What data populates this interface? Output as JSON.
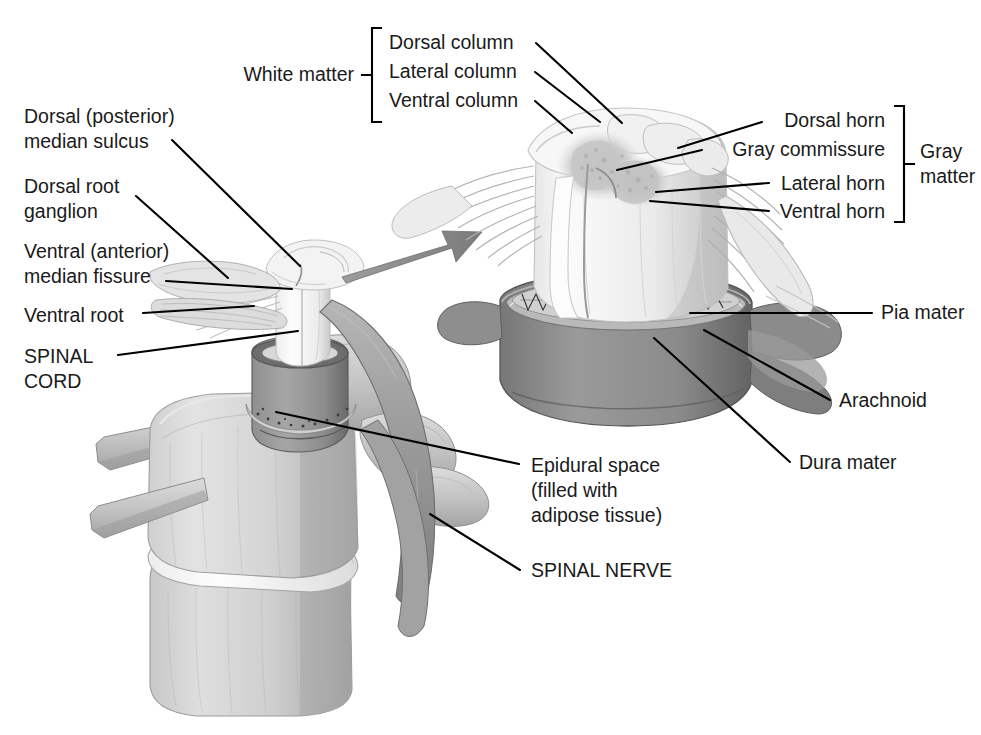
{
  "figure": {
    "background": "#ffffff",
    "width": 981,
    "height": 735
  },
  "palette": {
    "ink": "#1a1a1a",
    "leader_line": "#000000",
    "bone_light": "#d8d8d8",
    "bone_mid": "#bdbdbd",
    "bone_shadow": "#9e9e9e",
    "dura_gray": "#8a8a8a",
    "dura_dark": "#6f6f6f",
    "nerve_gray": "#a8a8a8",
    "cord_white": "#fbfbfb",
    "gray_matter": "#c9c9c9",
    "arrow_gray": "#8e8e8e",
    "disc_white": "#f6f6f6"
  },
  "groups": {
    "white_matter": {
      "label": "White matter",
      "items": [
        {
          "label": "Dorsal column"
        },
        {
          "label": "Lateral column"
        },
        {
          "label": "Ventral column"
        }
      ]
    },
    "gray_matter": {
      "label_line1": "Gray",
      "label_line2": "matter",
      "items": [
        {
          "label": "Dorsal horn"
        },
        {
          "label": "Gray commissure"
        },
        {
          "label": "Lateral horn"
        },
        {
          "label": "Ventral horn"
        }
      ]
    }
  },
  "labels": {
    "dorsal_median_sulcus_line1": "Dorsal (posterior)",
    "dorsal_median_sulcus_line2": "median sulcus",
    "dorsal_root_ganglion_line1": "Dorsal root",
    "dorsal_root_ganglion_line2": "ganglion",
    "ventral_median_fissure_line1": "Ventral (anterior)",
    "ventral_median_fissure_line2": "median fissure",
    "ventral_root": "Ventral root",
    "spinal_cord_line1": "SPINAL",
    "spinal_cord_line2": "CORD",
    "epidural_space_line1": "Epidural space",
    "epidural_space_line2": "(filled with",
    "epidural_space_line3": "adipose tissue)",
    "spinal_nerve": "SPINAL NERVE",
    "pia_mater": "Pia mater",
    "arachnoid": "Arachnoid",
    "dura_mater": "Dura mater"
  },
  "illustrations": {
    "left": {
      "name": "vertebra-with-spinal-cord-in-situ",
      "description": "Two stacked vertebral bodies with intervertebral disc, spinal cord entering vertebral canal, dural sleeve, dorsal root ganglion and spinal nerve"
    },
    "right": {
      "name": "enlarged-spinal-cord-cross-section",
      "description": "Magnified spinal cord segment showing white matter columns, gray matter horns, rootlets and meningeal layers"
    },
    "arrow": {
      "name": "magnification-arrow",
      "description": "Gray tapered arrow pointing from the left view to the enlarged right view"
    }
  }
}
